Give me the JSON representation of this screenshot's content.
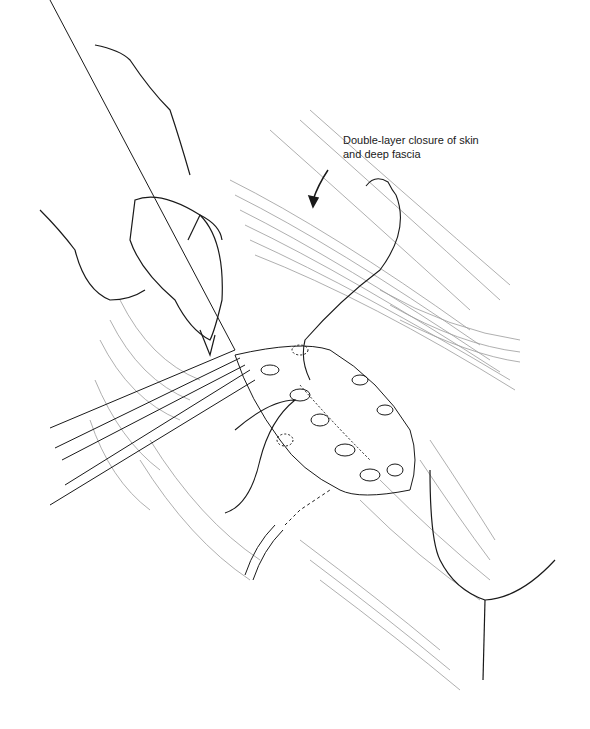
{
  "figure": {
    "type": "surgical line illustration",
    "annotation": {
      "line1": "Double-layer closure of skin",
      "line2": "and deep fascia"
    },
    "elements": [
      "surgeon-hand-with-glove",
      "forceps",
      "suture-needle-with-thread",
      "open-incision-wound",
      "drain-tube",
      "annotation-arrow",
      "skin-contour-lines"
    ],
    "colors": {
      "ink": "#1a1a1a",
      "hatch": "#8a8a8a",
      "background": "#ffffff"
    }
  }
}
